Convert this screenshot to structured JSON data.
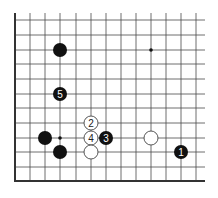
{
  "diagram": {
    "type": "go-board-partial",
    "colors": {
      "line": "#4a4a4a",
      "edge": "#333333",
      "black_stone": "#111111",
      "white_stone": "#ffffff",
      "white_stone_border": "#444444",
      "black_label": "#ffffff",
      "white_label": "#222222",
      "star": "#111111"
    },
    "grid": {
      "x_lines": [
        15,
        30,
        45,
        60,
        76,
        91,
        106,
        121,
        136,
        151,
        166,
        181,
        196
      ],
      "y_lines": [
        20,
        35,
        50,
        64,
        79,
        94,
        108,
        123,
        138,
        152,
        167,
        181
      ],
      "left_edge_x": 15,
      "bottom_edge_y": 181,
      "top_extent_y": 13,
      "right_extent_x": 205
    },
    "star_points": [
      {
        "x": 151,
        "y": 50
      },
      {
        "x": 60,
        "y": 138
      }
    ],
    "stones": [
      {
        "color": "black",
        "x": 60,
        "y": 50,
        "label": ""
      },
      {
        "color": "black",
        "x": 60,
        "y": 94,
        "label": "5"
      },
      {
        "color": "black",
        "x": 45,
        "y": 138,
        "label": ""
      },
      {
        "color": "black",
        "x": 60,
        "y": 152,
        "label": ""
      },
      {
        "color": "white",
        "x": 91,
        "y": 123,
        "label": "2"
      },
      {
        "color": "white",
        "x": 91,
        "y": 138,
        "label": "4"
      },
      {
        "color": "black",
        "x": 106,
        "y": 138,
        "label": "3"
      },
      {
        "color": "white",
        "x": 91,
        "y": 152,
        "label": ""
      },
      {
        "color": "white",
        "x": 151,
        "y": 138,
        "label": ""
      },
      {
        "color": "black",
        "x": 181,
        "y": 152,
        "label": "1"
      }
    ],
    "stone_radius": 7
  }
}
